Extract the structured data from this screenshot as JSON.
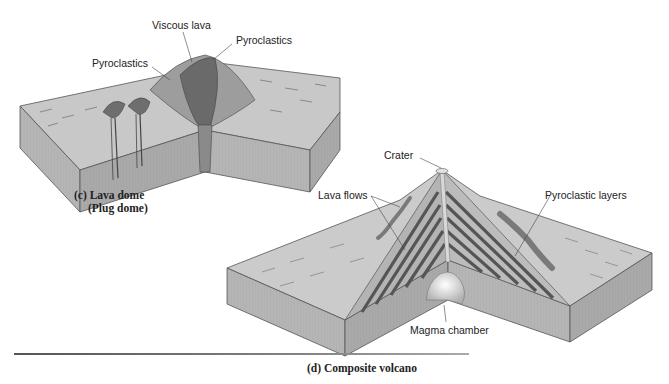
{
  "diagrams": [
    {
      "id": "lava-dome",
      "caption_line1": "(c) Lava dome",
      "caption_line2": "(Plug dome)",
      "labels": {
        "viscous_lava": "Viscous lava",
        "pyroclastics_left": "Pyroclastics",
        "pyroclastics_right": "Pyroclastics"
      }
    },
    {
      "id": "composite-volcano",
      "caption": "(d) Composite volcano",
      "labels": {
        "crater": "Crater",
        "lava_flows": "Lava flows",
        "pyroclastic_layers": "Pyroclastic layers",
        "magma_chamber": "Magma chamber"
      }
    }
  ],
  "colors": {
    "surface": "#c9c9c9",
    "side_front": "#a8a8a8",
    "side_right": "#b8b8b8",
    "dark_layer": "#555555",
    "dome": "#6e6e6e"
  }
}
